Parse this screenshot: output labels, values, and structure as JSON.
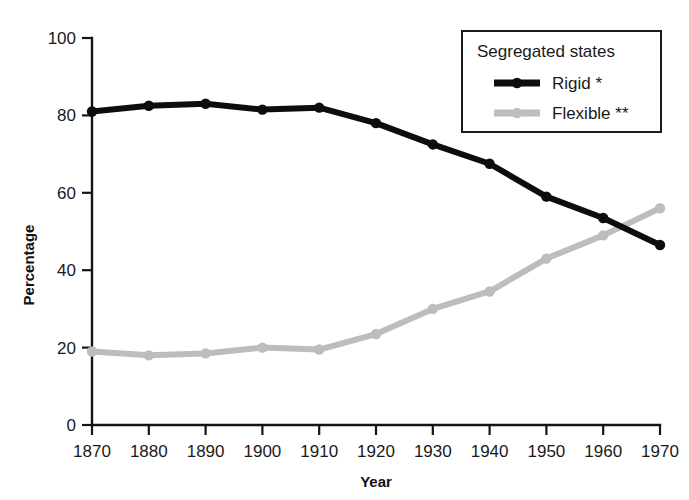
{
  "chart_data": {
    "type": "line",
    "title": "",
    "xlabel": "Year",
    "ylabel": "Percentage",
    "x": [
      1870,
      1880,
      1890,
      1900,
      1910,
      1920,
      1930,
      1940,
      1950,
      1960,
      1970
    ],
    "xtick_labels": [
      "1870",
      "1880",
      "1890",
      "1900",
      "1910",
      "1920",
      "1930",
      "1940",
      "1950",
      "1960",
      "1970"
    ],
    "ytick_labels": [
      "0",
      "20",
      "40",
      "60",
      "80",
      "100"
    ],
    "yticks": [
      0,
      20,
      40,
      60,
      80,
      100
    ],
    "xlim": [
      1870,
      1970
    ],
    "ylim": [
      0,
      100
    ],
    "grid": false,
    "legend_position": "top-right",
    "legend_title": "Segregated states",
    "series": [
      {
        "name": "Rigid *",
        "color": "#0d0d0d",
        "marker": "circle",
        "values": [
          81,
          82.5,
          83,
          81.5,
          82,
          78,
          72.5,
          67.5,
          59,
          53.5,
          46.5
        ]
      },
      {
        "name": "Flexible **",
        "color": "#bdbdbd",
        "marker": "circle",
        "values": [
          19,
          18,
          18.5,
          20,
          19.5,
          23.5,
          30,
          34.5,
          43,
          49,
          56
        ]
      }
    ]
  },
  "legend": {
    "title": "Segregated states",
    "items": [
      {
        "label": "Rigid *",
        "color": "#0d0d0d"
      },
      {
        "label": "Flexible **",
        "color": "#bdbdbd"
      }
    ]
  },
  "axes": {
    "x_title": "Year",
    "y_title": "Percentage"
  }
}
